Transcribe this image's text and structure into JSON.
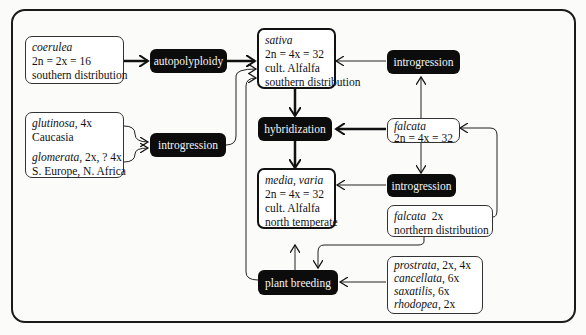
{
  "diagram": {
    "species_boxes": {
      "coerulea": {
        "name": "coerulea",
        "ploidy": "2n = 2x = 16",
        "note": "southern distribution"
      },
      "glutinosa_glomerata": {
        "name1": "glutinosa",
        "ploidy1": ", 4x",
        "region1": "Caucasia",
        "name2": "glomerata",
        "ploidy2": ", 2x, ? 4x",
        "region2": "S. Europe, N. Africa"
      },
      "sativa": {
        "name": "sativa",
        "ploidy": "2n = 4x = 32",
        "line3": "cult. Alfalfa",
        "note": "southern distribution"
      },
      "media_varia": {
        "name": "media, varia",
        "ploidy": "2n = 4x = 32",
        "line3": "cult. Alfalfa",
        "note": "north temperate"
      },
      "falcata_4x": {
        "name": "falcata",
        "ploidy": "2n = 4x = 32"
      },
      "falcata_2x": {
        "name": "falcata",
        "ploidy": "2x",
        "note": "northern distribution"
      },
      "others": [
        {
          "name": "prostrata",
          "ploidy": ", 2x, 4x"
        },
        {
          "name": "cancellata",
          "ploidy": ", 6x"
        },
        {
          "name": "saxatilis",
          "ploidy": ", 6x"
        },
        {
          "name": "rhodopea",
          "ploidy": ", 2x"
        }
      ]
    },
    "processes": {
      "autopolyploidy": "autopolyploidy",
      "introgression_left": "introgression",
      "introgression_top": "introgression",
      "hybridization": "hybridization",
      "introgression_mid": "introgression",
      "plant_breeding": "plant breeding"
    },
    "colors": {
      "process_fill": "#0c0c0c",
      "process_text": "#f4f4f4",
      "line": "#222222",
      "background": "#fbfbfa"
    }
  }
}
